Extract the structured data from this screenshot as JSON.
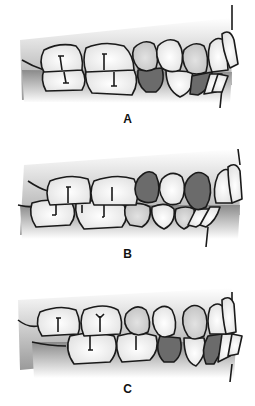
{
  "figure": {
    "panels": [
      {
        "id": "A",
        "label": "A",
        "highlighted_teeth": [
          "lower-canine",
          "lower-first-premolar-region"
        ]
      },
      {
        "id": "B",
        "label": "B",
        "highlighted_teeth": [
          "upper-second-premolar",
          "upper-canine"
        ]
      },
      {
        "id": "C",
        "label": "C",
        "highlighted_teeth": [
          "lower-first-premolar",
          "lower-canine"
        ]
      }
    ],
    "colors": {
      "outline": "#1a1a1a",
      "tooth_light": "#f4f4f4",
      "tooth_mid": "#d4d4d4",
      "tooth_dark": "#6b6b6b",
      "gum_dark": "#8c8c8c",
      "background": "#ffffff"
    }
  }
}
